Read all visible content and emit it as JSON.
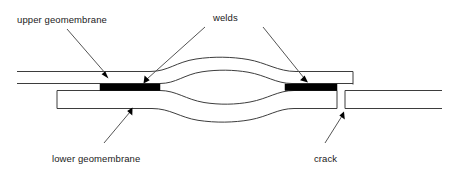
{
  "diagram": {
    "background_color": "#ffffff",
    "line_color": "#3d3d3d",
    "weld_color": "#000000",
    "leader_color": "#555555",
    "text_color": "#1a1a1a",
    "labels": {
      "upper_geomembrane": "upper geomembrane",
      "welds": "welds",
      "lower_geomembrane": "lower geomembrane",
      "crack": "crack"
    },
    "parts": [
      {
        "name": "upper-geomembrane",
        "label": "upper geomembrane",
        "description": "Top sheet drawn as two parallel lines that bulge upward over the central void and terminate at the right above the crack."
      },
      {
        "name": "lower-geomembrane",
        "label": "lower geomembrane",
        "description": "Bottom sheet drawn as a long rectangle whose upper edge bulges downward over the central void; it is interrupted by a vertical crack near the right."
      },
      {
        "name": "weld-left",
        "label": "welds",
        "description": "Solid black bond between the upper and lower geomembranes on the left of the void."
      },
      {
        "name": "weld-right",
        "label": "welds",
        "description": "Solid black bond between the upper and lower geomembranes on the right of the void."
      },
      {
        "name": "crack",
        "label": "crack",
        "description": "Vertical break separating two segments of the lower geomembrane to the right of the right weld."
      },
      {
        "name": "void",
        "label": "",
        "description": "Lens-shaped gap between the two geomembranes between the welds."
      }
    ]
  }
}
